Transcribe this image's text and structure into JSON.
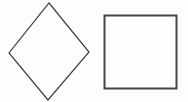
{
  "canvas": {
    "width": 188,
    "height": 102,
    "background_color": "#fdfdfd",
    "title": "Two quadrilaterals: a diamond and a square"
  },
  "shapes": [
    {
      "name": "diamond",
      "label": "Diamond (square rotated 45 degrees)",
      "kind": "polygon",
      "sides": 4,
      "points": "49,3 89,52 48,100 9,53",
      "vertices": [
        {
          "label": "top",
          "x": 49,
          "y": 3
        },
        {
          "label": "right",
          "x": 89,
          "y": 52
        },
        {
          "label": "bottom",
          "x": 48,
          "y": 100
        },
        {
          "label": "left",
          "x": 9,
          "y": 53
        }
      ],
      "stroke_color": "#3d3d3d",
      "stroke_width": 1.2,
      "fill": "none",
      "width": 80,
      "height": 97
    },
    {
      "name": "square",
      "label": "Axis-aligned square",
      "kind": "rect",
      "sides": 4,
      "x": 104.5,
      "y": 15.5,
      "width": 72,
      "height": 73,
      "stroke_color": "#444444",
      "stroke_width": 2,
      "fill": "none"
    }
  ]
}
